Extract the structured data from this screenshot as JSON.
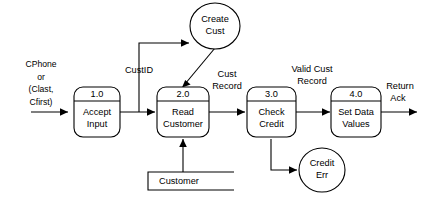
{
  "diagram": {
    "type": "data-flow-diagram",
    "title": "",
    "processes": [
      {
        "number": "1.0",
        "name_line1": "Accept",
        "name_line2": "Input"
      },
      {
        "number": "2.0",
        "name_line1": "Read",
        "name_line2": "Customer"
      },
      {
        "number": "3.0",
        "name_line1": "Check",
        "name_line2": "Credit"
      },
      {
        "number": "4.0",
        "name_line1": "Set Data",
        "name_line2": "Values"
      }
    ],
    "entities": [
      {
        "id": "create-cust",
        "line1": "Create",
        "line2": "Cust"
      },
      {
        "id": "credit-err",
        "line1": "Credit",
        "line2": "Err"
      }
    ],
    "datastores": [
      {
        "id": "customer-store",
        "label": "Customer"
      }
    ],
    "input_source": {
      "line1": "CPhone",
      "line2": "or",
      "line3": "(Clast,",
      "line4": "Cfirst)"
    },
    "flow_labels": [
      {
        "id": "custid",
        "text": "CustID"
      },
      {
        "id": "cust-record-line1",
        "text": "Cust"
      },
      {
        "id": "cust-record-line2",
        "text": "Record"
      },
      {
        "id": "valid-cust-line1",
        "text": "Valid Cust"
      },
      {
        "id": "valid-cust-line2",
        "text": "Record"
      },
      {
        "id": "return-ack-line1",
        "text": "Return"
      },
      {
        "id": "return-ack-line2",
        "text": "Ack"
      }
    ],
    "colors": {
      "stroke": "#000000",
      "fill": "#ffffff",
      "background": "#ffffff"
    }
  }
}
